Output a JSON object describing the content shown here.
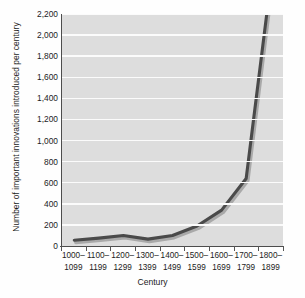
{
  "chart_data": {
    "type": "line",
    "title": "",
    "xlabel": "Century",
    "ylabel": "Number of important innovations introduced per century",
    "categories": [
      "1000–\n1099",
      "1100–\n1199",
      "1200–\n1299",
      "1300–\n1399",
      "1400–\n1499",
      "1500–\n1599",
      "1600–\n1699",
      "1700–\n1799",
      "1800–\n1899"
    ],
    "category_lines": [
      [
        "1000–",
        "1099"
      ],
      [
        "1100–",
        "1199"
      ],
      [
        "1200–",
        "1299"
      ],
      [
        "1300–",
        "1399"
      ],
      [
        "1400–",
        "1499"
      ],
      [
        "1500–",
        "1599"
      ],
      [
        "1600–",
        "1699"
      ],
      [
        "1700–",
        "1799"
      ],
      [
        "1800–",
        "1899"
      ]
    ],
    "values": [
      55,
      75,
      100,
      65,
      100,
      190,
      340,
      640,
      2500
    ],
    "clipped_at_top": true,
    "clip_value": 2200,
    "ylim": [
      0,
      2200
    ],
    "ytick_step": 200,
    "ytick_labels": [
      "0",
      "200",
      "400",
      "600",
      "800",
      "1,000",
      "1,200",
      "1,400",
      "1,600",
      "1,800",
      "2,000",
      "2,200"
    ],
    "ytick_values": [
      0,
      200,
      400,
      600,
      800,
      1000,
      1200,
      1400,
      1600,
      1800,
      2000,
      2200
    ],
    "grid": "horizontal",
    "legend": "none",
    "colors": {
      "line": "#4a4a4a",
      "line_shadow": "#a9a9a9",
      "plot_background": "#dddddd",
      "gridline": "#fbfbfb",
      "axis": "#4d4d4d",
      "page_background": "#fefefe",
      "text": "#1c1c1c"
    }
  }
}
